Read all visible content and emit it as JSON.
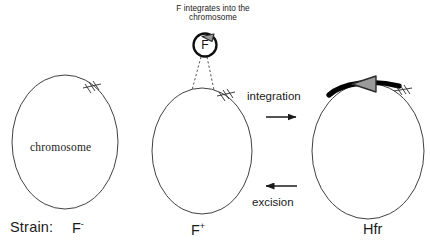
{
  "diagram": {
    "title_caption": "F integrates into the\nchromosome",
    "caption_line1": "F integrates into the",
    "caption_line2": "chromosome",
    "plasmid_label": "F",
    "chromosome_label": "chromosome",
    "process_forward": "integration",
    "process_reverse": "excision",
    "strain_prefix": "Strain:",
    "strains": [
      {
        "name": "F",
        "superscript": "-",
        "full": "F -"
      },
      {
        "name": "F",
        "superscript": "+",
        "full": "F +"
      },
      {
        "name": "Hfr",
        "superscript": "",
        "full": "Hfr"
      }
    ],
    "colors": {
      "background": "#ffffff",
      "stroke": "#1a1a1a",
      "text": "#1a1a1a",
      "f_insert_black": "#000000",
      "arrowhead_gray": "#9a9a9a",
      "arrowhead_outline": "#2b2b2b"
    }
  }
}
